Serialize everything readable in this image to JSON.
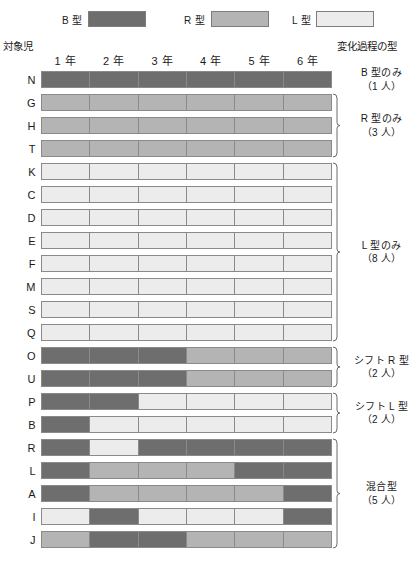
{
  "legend": {
    "items": [
      {
        "label": "B 型",
        "key": "B",
        "color": "#6e6e6e"
      },
      {
        "label": "R 型",
        "key": "R",
        "color": "#b4b4b4"
      },
      {
        "label": "L 型",
        "key": "L",
        "color": "#ececed"
      }
    ]
  },
  "headers": {
    "subject": "対象児",
    "process": "変化過程の型"
  },
  "chart_data": {
    "type": "heatmap",
    "title": "",
    "xlabel": "",
    "ylabel": "対象児",
    "categories": [
      "1 年",
      "2 年",
      "3 年",
      "4 年",
      "5 年",
      "6 年"
    ],
    "value_legend": {
      "B": {
        "label": "B 型",
        "color": "#6e6e6e"
      },
      "R": {
        "label": "R 型",
        "color": "#b4b4b4"
      },
      "L": {
        "label": "L 型",
        "color": "#ececed"
      }
    },
    "rows": [
      {
        "id": "N",
        "values": [
          "B",
          "B",
          "B",
          "B",
          "B",
          "B"
        ]
      },
      {
        "id": "G",
        "values": [
          "R",
          "R",
          "R",
          "R",
          "R",
          "R"
        ]
      },
      {
        "id": "H",
        "values": [
          "R",
          "R",
          "R",
          "R",
          "R",
          "R"
        ]
      },
      {
        "id": "T",
        "values": [
          "R",
          "R",
          "R",
          "R",
          "R",
          "R"
        ]
      },
      {
        "id": "K",
        "values": [
          "L",
          "L",
          "L",
          "L",
          "L",
          "L"
        ]
      },
      {
        "id": "C",
        "values": [
          "L",
          "L",
          "L",
          "L",
          "L",
          "L"
        ]
      },
      {
        "id": "D",
        "values": [
          "L",
          "L",
          "L",
          "L",
          "L",
          "L"
        ]
      },
      {
        "id": "E",
        "values": [
          "L",
          "L",
          "L",
          "L",
          "L",
          "L"
        ]
      },
      {
        "id": "F",
        "values": [
          "L",
          "L",
          "L",
          "L",
          "L",
          "L"
        ]
      },
      {
        "id": "M",
        "values": [
          "L",
          "L",
          "L",
          "L",
          "L",
          "L"
        ]
      },
      {
        "id": "S",
        "values": [
          "L",
          "L",
          "L",
          "L",
          "L",
          "L"
        ]
      },
      {
        "id": "Q",
        "values": [
          "L",
          "L",
          "L",
          "L",
          "L",
          "L"
        ]
      },
      {
        "id": "O",
        "values": [
          "B",
          "B",
          "B",
          "R",
          "R",
          "R"
        ]
      },
      {
        "id": "U",
        "values": [
          "B",
          "B",
          "B",
          "R",
          "R",
          "R"
        ]
      },
      {
        "id": "P",
        "values": [
          "B",
          "B",
          "L",
          "L",
          "L",
          "L"
        ]
      },
      {
        "id": "B",
        "values": [
          "B",
          "L",
          "L",
          "L",
          "L",
          "L"
        ]
      },
      {
        "id": "R",
        "values": [
          "B",
          "L",
          "B",
          "B",
          "B",
          "B"
        ]
      },
      {
        "id": "L",
        "values": [
          "B",
          "R",
          "R",
          "R",
          "B",
          "B"
        ]
      },
      {
        "id": "A",
        "values": [
          "B",
          "R",
          "R",
          "R",
          "R",
          "B"
        ]
      },
      {
        "id": "I",
        "values": [
          "L",
          "B",
          "L",
          "L",
          "L",
          "B"
        ]
      },
      {
        "id": "J",
        "values": [
          "R",
          "B",
          "B",
          "R",
          "R",
          "R"
        ]
      }
    ],
    "groups": [
      {
        "name": "B 型のみ",
        "count": "（1 人）",
        "start": 0,
        "span": 1,
        "brace": false
      },
      {
        "name": "R 型のみ",
        "count": "（3 人）",
        "start": 1,
        "span": 3,
        "brace": true
      },
      {
        "name": "L 型のみ",
        "count": "（8 人）",
        "start": 4,
        "span": 8,
        "brace": true
      },
      {
        "name": "シフト R 型",
        "count": "（2 人）",
        "start": 12,
        "span": 2,
        "brace": true
      },
      {
        "name": "シフト L 型",
        "count": "（2 人）",
        "start": 14,
        "span": 2,
        "brace": true
      },
      {
        "name": "混合型",
        "count": "（5 人）",
        "start": 16,
        "span": 5,
        "brace": true
      }
    ]
  }
}
